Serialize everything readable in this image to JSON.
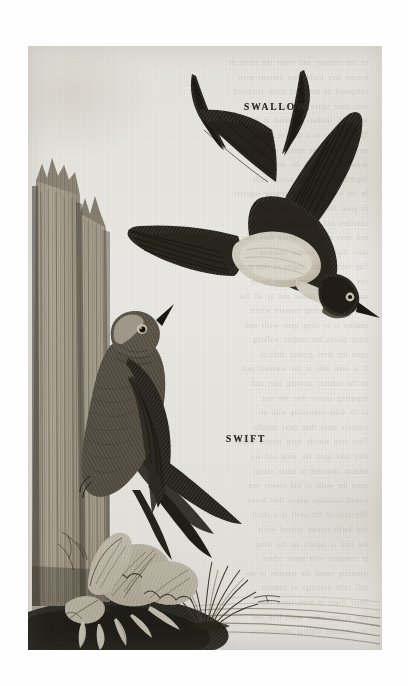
{
  "plate": {
    "kind": "antique-engraving",
    "medium": "wood-engraving on aged paper",
    "paper_color": "#e9e8e4",
    "ink_color": "#2c2a27",
    "labels": {
      "swallow": "SWALLOW.",
      "swift": "SWIFT"
    },
    "subjects": [
      {
        "name": "swallow",
        "pose": "in flight, diving to the right",
        "features": [
          "deeply forked tail streamers",
          "dark glossy upperparts",
          "pale cream belly and underwing",
          "pointed beak",
          "white eye-ring"
        ]
      },
      {
        "name": "swift",
        "pose": "clinging vertically to a weathered wooden post",
        "features": [
          "sooty brown plumage",
          "pale throat patch",
          "long scythe wings",
          "forked tail",
          "short upturned bill"
        ]
      }
    ],
    "scenery": [
      "split weathered fence post at left",
      "ruffled dock leaves at the base of the post",
      "tuft of grass at lower right",
      "small flying insect near the grass",
      "dark shaded ground with receding hatched horizon"
    ],
    "ghost_text": [
      "of the chimney and under the eaves of",
      "houses they build their curious nests",
      "composed of mud and straw tempered",
      "with their saliva and lined within",
      "with soft feathers gathered in the air",
      "The swallow is a bird of passage and",
      "arrives about the middle of April",
      "departing again in the month of",
      "September when the season fails",
      "In the evening they assemble together",
      "in great flocks upon the roofs of",
      "churches and other lofty buildings",
      "and after much chattering they take",
      "their flight to warmer climates",
      "The swift is the largest of this genus",
      "and is easily distinguished by its",
      "uniform sooty colour and by all the",
      "four toes standing forward which",
      "enables it to cling upon walls and",
      "steep places but renders walking",
      "upon the level ground difficult",
      "It is seen only in the warmest part",
      "of the summer arriving later and",
      "departing sooner than the rest",
      "of its tribe continuing with us",
      "scarcely more than three months",
      "They feed wholly upon insects which",
      "they take upon the wing and are",
      "seldom observed to settle except",
      "upon the walls of old towers and",
      "ruined buildings where they breed",
      "The note of the swift is a shrill",
      "and harsh scream uttered while",
      "the bird is rapidly on the wing",
      "in company with many others",
      "wheeling round the steeples in the",
      "still calm evenings of summer",
      "Their flight is more rapid than",
      "that of any other small bird and",
      "is continued without intermission"
    ]
  }
}
